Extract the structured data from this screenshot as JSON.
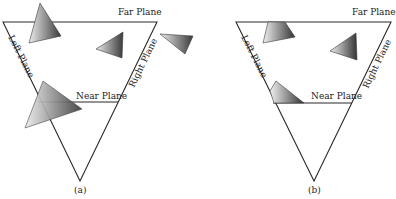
{
  "figure": {
    "panels": [
      {
        "id": "a",
        "caption": "(a)",
        "labels": {
          "far": "Far Plane",
          "near": "Near Plane",
          "left": "Left Plane",
          "right": "Right Plane"
        },
        "description": "Unclipped triangles relative to view frustum"
      },
      {
        "id": "b",
        "caption": "(b)",
        "labels": {
          "far": "Far Plane",
          "near": "Near Plane",
          "left": "Left Plane",
          "right": "Right Plane"
        },
        "description": "Triangles after clipping to view frustum"
      }
    ]
  },
  "colors": {
    "line": "#2a2a2a",
    "shade_dark": "#3c3c3c",
    "shade_light": "#e6e6e6"
  }
}
